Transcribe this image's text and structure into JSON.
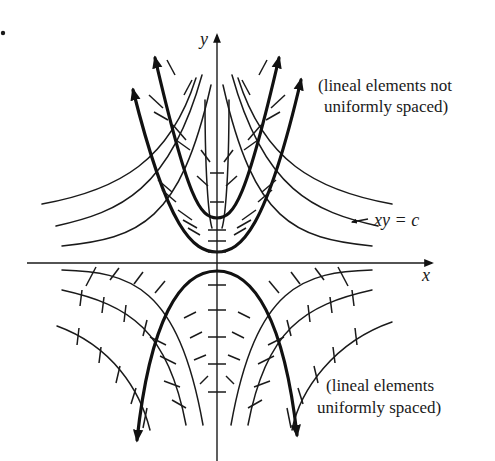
{
  "figure": {
    "bullet": "•",
    "axis_x_label": "x",
    "axis_y_label": "y",
    "curve_label": "xy = c",
    "note_top_line1": "(lineal elements not",
    "note_top_line2": "uniformly spaced)",
    "note_bottom_line1": "(lineal elements",
    "note_bottom_line2": "uniformly spaced)",
    "colors": {
      "ink": "#1a1a1a",
      "background": "#ffffff"
    }
  },
  "geometry": {
    "origin": [
      217,
      263
    ],
    "x_axis": [
      27,
      432
    ],
    "y_axis": [
      463,
      35
    ],
    "upper_hyperbolas": [
      "M62,204 C120,190 170,160 198,85",
      "M44,225 C100,212 160,195 207,90",
      "M42,238 C120,232 170,222 210,105",
      "M372,204 C314,190 264,160 236,85",
      "M390,225 C334,212 274,195 227,90",
      "M392,238 C314,232 264,222 224,105"
    ],
    "upper_inner_bold": "M155,52 C190,200 200,218 217,218 C234,218 244,200 279,52",
    "upper_outer_bold": "M133,85 C170,230 195,250 217,250 C239,250 264,230 301,80",
    "lower_bold": "M137,440 C150,320 180,270 217,270 C254,270 284,320 297,435",
    "lower_thin": [
      "M62,270 C130,272 175,285 200,440",
      "M50,290 C120,305 165,330 187,430",
      "M57,325 C110,345 140,380 150,430",
      "M372,270 C304,272 259,285 234,440",
      "M384,290 C314,305 269,330 247,430",
      "M377,325 C324,345 294,380 284,430"
    ],
    "center_ticks_y": [
      77,
      125,
      157,
      173,
      188,
      222,
      230,
      240,
      248,
      255,
      282,
      305,
      330,
      357,
      390,
      415
    ]
  }
}
